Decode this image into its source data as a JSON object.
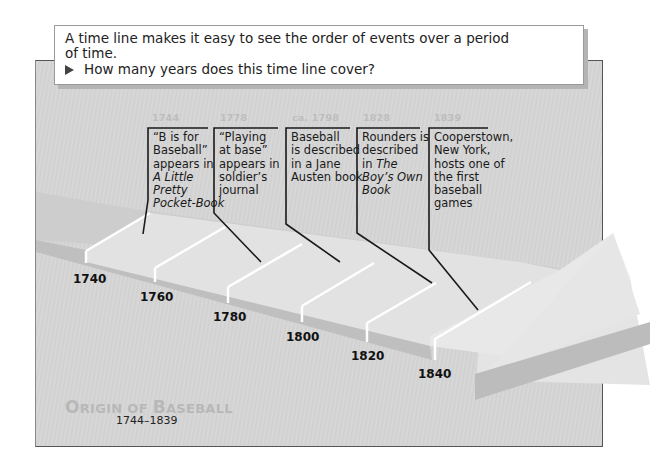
{
  "note": {
    "intro": "A time line makes it easy to see the order of events over a period of time.",
    "intro_line1": "A time line makes it easy to see the order of events over a period",
    "intro_line2": "of time.",
    "question": "How many years does this time line cover?",
    "bullet_icon": "right-triangle-icon"
  },
  "timeline": {
    "title_first_O": "O",
    "title_rest_1": "RIGIN OF ",
    "title_B": "B",
    "title_rest_2": "ASEBALL",
    "title": "Origin of Baseball",
    "range": "1744–1839",
    "scale_labels": [
      "1740",
      "1760",
      "1780",
      "1800",
      "1820",
      "1840"
    ],
    "events": [
      {
        "year": "1744",
        "lines": [
          "“B is for",
          "Baseball”",
          "appears in"
        ],
        "italic_lines": [
          "A Little",
          "Pretty",
          "Pocket-Book"
        ],
        "text": "“B is for Baseball” appears in A Little Pretty Pocket-Book"
      },
      {
        "year": "1778",
        "lines": [
          "“Playing",
          "at base”",
          "appears in",
          "soldier’s",
          "journal"
        ],
        "text": "“Playing at base” appears in soldier’s journal"
      },
      {
        "year": "ca. 1798",
        "lines": [
          "Baseball",
          "is described",
          "in a Jane",
          "Austen book"
        ],
        "text": "Baseball is described in a Jane Austen book"
      },
      {
        "year": "1828",
        "lines": [
          "Rounders is",
          "described",
          "in "
        ],
        "italic_inline": "The",
        "italic_lines": [
          "Boy’s Own",
          "Book"
        ],
        "text": "Rounders is described in The Boy’s Own Book"
      },
      {
        "year": "1839",
        "lines": [
          "Cooperstown,",
          "New York,",
          "hosts one of",
          "the first",
          "baseball",
          "games"
        ],
        "text": "Cooperstown, New York, hosts one of the first baseball games"
      }
    ]
  },
  "colors": {
    "panel": "#d4d4d4",
    "arrow_top": "#e6e6e6",
    "arrow_side": "#bdbdbd",
    "title_gray": "#b8b8b8",
    "year_gray": "#bdbdbd"
  }
}
